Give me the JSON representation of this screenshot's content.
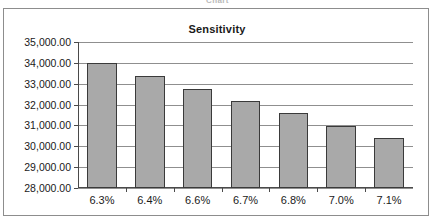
{
  "clipped_caption": "Chart",
  "chart_data": {
    "type": "bar",
    "title": "Sensitivity",
    "xlabel": "",
    "ylabel": "",
    "categories": [
      "6.3%",
      "6.4%",
      "6.6%",
      "6.7%",
      "6.8%",
      "7.0%",
      "7.1%"
    ],
    "values": [
      33980,
      33370,
      32760,
      32180,
      31580,
      30990,
      30420
    ],
    "ylim": [
      28000,
      35000
    ],
    "ytick_step": 1000,
    "ytick_labels": [
      "35,000.00",
      "34,000.00",
      "33,000.00",
      "32,000.00",
      "31,000.00",
      "30,000.00",
      "29,000.00",
      "28,000.00"
    ],
    "ytick_values": [
      35000,
      34000,
      33000,
      32000,
      31000,
      30000,
      29000,
      28000
    ],
    "grid": true,
    "legend": false,
    "legend_position": "none",
    "series": [
      {
        "name": "Sensitivity",
        "values": [
          33980,
          33370,
          32760,
          32180,
          31580,
          30990,
          30420
        ]
      }
    ],
    "colors": {
      "bar_fill": "#a9a9a9",
      "bar_border": "#3a3a3a",
      "gridline": "#8f8f8f",
      "axis": "#4a4a4a",
      "frame": "#8d8d8d",
      "text": "#1a1a1a",
      "background": "#ffffff"
    }
  }
}
